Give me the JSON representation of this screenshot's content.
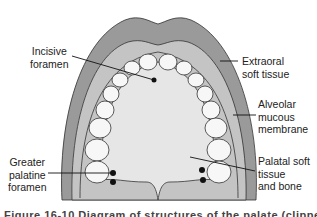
{
  "figure": {
    "labels": {
      "incisive_foramen": [
        "Incisive",
        "foramen"
      ],
      "extraoral_soft_tissue": [
        "Extraoral",
        "soft tissue"
      ],
      "alveolar_mucous_membrane": [
        "Alveolar",
        "mucous",
        "membrane"
      ],
      "palatal_soft_tissue": [
        "Palatal soft",
        "tissue",
        "and bone"
      ],
      "greater_palatine_foramen": [
        "Greater",
        "palatine",
        "foramen"
      ]
    },
    "caption": "Figure 16-10  Diagram of structures of the palate (clipped)",
    "colors": {
      "extraoral": "#9a9a9a",
      "alveolar": "#c4c4c4",
      "palate": "#e6e6e6",
      "tooth": "#f7f7f7",
      "outline": "#333333"
    }
  }
}
